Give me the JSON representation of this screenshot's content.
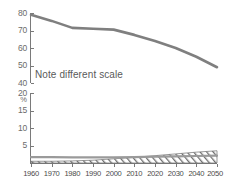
{
  "chart_data": {
    "type": "line",
    "title": "",
    "xlabel": "",
    "ylabel": "%",
    "annotation": "Note different scale",
    "grid": false,
    "legend": "none",
    "broken_axis": true,
    "x": [
      1960,
      1970,
      1980,
      1990,
      2000,
      2010,
      2020,
      2030,
      2040,
      2050
    ],
    "xlim": [
      1960,
      2050
    ],
    "panels": [
      {
        "name": "upper-panel",
        "ylim": [
          40,
          80
        ],
        "yticks": [
          80,
          70,
          60,
          50,
          40
        ],
        "ytick_labels": [
          "80",
          "70",
          "60",
          "50",
          "40"
        ],
        "series": [
          {
            "name": "upper-declining-line",
            "style": "line",
            "color": "#7f7f7f",
            "values": [
              79,
              75.5,
              71.5,
              71,
              70.5,
              67.5,
              64,
              60,
              55,
              49
            ]
          }
        ]
      },
      {
        "name": "lower-panel",
        "ylim": [
          0,
          20
        ],
        "yticks": [
          20,
          15,
          10,
          5
        ],
        "ytick_labels": [
          "20",
          "15",
          "10",
          "5"
        ],
        "axis_unit": "%",
        "series": [
          {
            "name": "lower-flat-line",
            "style": "line",
            "color": "#9a9a9a",
            "values": [
              1.7,
              1.7,
              1.6,
              1.6,
              1.6,
              1.7,
              1.8,
              1.9,
              2.0,
              2.1
            ]
          },
          {
            "name": "lower-hatched-band",
            "style": "band-hatched",
            "color": "#6e6e6e",
            "upper_values": [
              0.5,
              0.5,
              0.6,
              0.8,
              1.2,
              1.6,
              2.1,
              2.6,
              3.1,
              3.5
            ],
            "lower_values": [
              0.0,
              0.0,
              0.0,
              0.0,
              0.0,
              0.0,
              0.0,
              0.0,
              0.0,
              0.0
            ]
          }
        ]
      }
    ],
    "xtick_labels": [
      "1960",
      "1970",
      "1980",
      "1990",
      "2000",
      "2010",
      "2020",
      "2030",
      "2040",
      "2050"
    ]
  },
  "colors": {
    "axis": "#7a7a7a",
    "upper_line": "#7f7f7f",
    "lower_line": "#9a9a9a",
    "hatch": "#6e6e6e",
    "tick_text": "#6b6b6b",
    "xlabel_text": "#4a4a4a",
    "note_text": "#5a5a5a"
  }
}
